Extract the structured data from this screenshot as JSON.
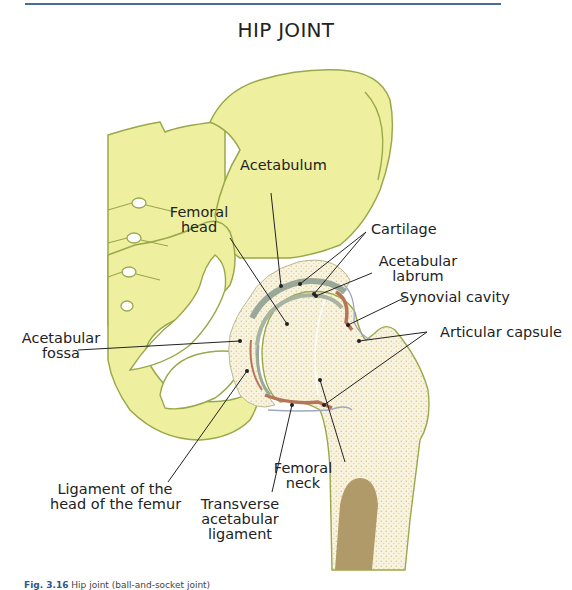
{
  "figure": {
    "title": "HIP JOINT",
    "caption_prefix": "Fig. 3.16",
    "caption_text": "Hip joint (ball-and-socket joint)"
  },
  "labels": {
    "acetabulum": "Acetabulum",
    "femoral_head_line1": "Femoral",
    "femoral_head_line2": "head",
    "cartilage": "Cartilage",
    "acetabular_labrum_line1": "Acetabular",
    "acetabular_labrum_line2": "labrum",
    "synovial_cavity": "Synovial cavity",
    "articular_capsule": "Articular capsule",
    "acetabular_fossa_line1": "Acetabular",
    "acetabular_fossa_line2": "fossa",
    "ligament_head_line1": "Ligament of the",
    "ligament_head_line2": "head of the femur",
    "femoral_neck_line1": "Femoral",
    "femoral_neck_line2": "neck",
    "transverse_line1": "Transverse",
    "transverse_line2": "acetabular",
    "transverse_line3": "ligament"
  },
  "colors": {
    "pelvis_fill": "#eef0a0",
    "pelvis_stroke": "#9aa84a",
    "bone_fill": "#f7f1da",
    "bone_dots": "#d8c48a",
    "cartilage": "#9aa89a",
    "synovial": "#b8745a",
    "marrow": "#b09a6a",
    "leader_line": "#222222",
    "rule": "#4a6a9a"
  }
}
